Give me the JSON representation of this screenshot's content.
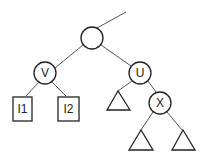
{
  "diagram": {
    "type": "tree",
    "nodes": {
      "root": {
        "label": ""
      },
      "v": {
        "label": "V"
      },
      "u": {
        "label": "U"
      },
      "x": {
        "label": "X"
      },
      "i1": {
        "label": "I1"
      },
      "i2": {
        "label": "I2"
      }
    },
    "subtrees": [
      "u-left-subtree",
      "x-left-subtree",
      "x-right-subtree"
    ],
    "edges": [
      [
        "parent",
        "root"
      ],
      [
        "root",
        "v"
      ],
      [
        "root",
        "u"
      ],
      [
        "v",
        "i1"
      ],
      [
        "v",
        "i2"
      ],
      [
        "u",
        "u-left-subtree"
      ],
      [
        "u",
        "x"
      ],
      [
        "x",
        "x-left-subtree"
      ],
      [
        "x",
        "x-right-subtree"
      ]
    ]
  }
}
